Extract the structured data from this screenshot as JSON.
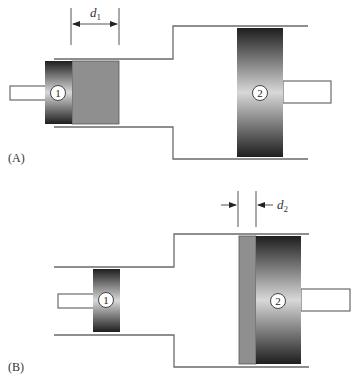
{
  "figure": {
    "panels": [
      {
        "id": "A",
        "label": "(A)",
        "dimension": {
          "symbol": "d",
          "subscript": "1"
        },
        "small_piston": {
          "number": "1"
        },
        "large_piston": {
          "number": "2"
        }
      },
      {
        "id": "B",
        "label": "(B)",
        "dimension": {
          "symbol": "d",
          "subscript": "2"
        },
        "small_piston": {
          "number": "1"
        },
        "large_piston": {
          "number": "2"
        }
      }
    ],
    "colors": {
      "fluid": "#8f8f8f",
      "piston_dark": "#1e1e1e",
      "piston_light": "#d8d8d8",
      "wall": "#6a6a6a"
    }
  }
}
